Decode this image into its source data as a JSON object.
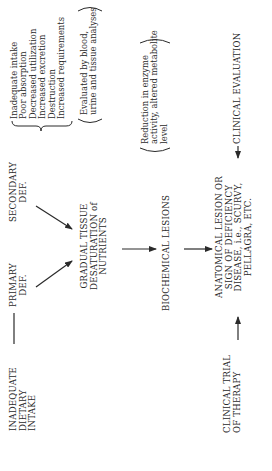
{
  "diagram": {
    "orientation": "rotated-90-ccw",
    "nodes": {
      "inadequate_intake": {
        "lines": [
          "INADEQUATE",
          "DIETARY",
          "INTAKE"
        ]
      },
      "primary_def": {
        "lines": [
          "PRIMARY",
          "DEF."
        ]
      },
      "secondary_def": {
        "lines": [
          "SECONDARY",
          "DEF."
        ]
      },
      "secondary_causes": {
        "lines": [
          "Inadequate intake",
          "Poor absorption",
          "Decreased utilization",
          "Increased excretion",
          "Destruction",
          "Increased requirements"
        ]
      },
      "gradual_tissue": {
        "lines": [
          "GRADUAL TISSUE",
          "DESATURATION of",
          "NUTRIENTS"
        ]
      },
      "tissue_note": {
        "lines": [
          "Evaluated by blood,",
          "urine and tissue analyses"
        ]
      },
      "biochemical_lesions": {
        "lines": [
          "BIOCHEMICAL LESIONS"
        ]
      },
      "biochemical_note": {
        "lines": [
          "Reduction in enzyme",
          "activity, altered metabolite",
          "level"
        ]
      },
      "anatomical_lesion": {
        "lines": [
          "ANATOMICAL LESION OR",
          "SIGN OF DEFICIENCY",
          "DISEASE, i.e., SCURVY,",
          "PELLAGRA, ETC."
        ]
      },
      "clinical_evaluation": {
        "lines": [
          "CLINICAL EVALUATION"
        ]
      },
      "clinical_trial": {
        "lines": [
          "CLINICAL TRIAL",
          "OF THERAPY"
        ]
      }
    },
    "edges": [
      {
        "from": "inadequate_intake",
        "to": "primary_def",
        "style": "line"
      },
      {
        "from": "primary_def",
        "to": "gradual_tissue",
        "style": "arrow"
      },
      {
        "from": "secondary_def",
        "to": "gradual_tissue",
        "style": "arrow"
      },
      {
        "from": "gradual_tissue",
        "to": "biochemical_lesions",
        "style": "arrow"
      },
      {
        "from": "biochemical_lesions",
        "to": "anatomical_lesion",
        "style": "arrow"
      },
      {
        "from": "clinical_trial",
        "to": "anatomical_lesion",
        "style": "arrow"
      },
      {
        "from": "clinical_evaluation",
        "to": "anatomical_lesion",
        "style": "arrow"
      }
    ]
  }
}
